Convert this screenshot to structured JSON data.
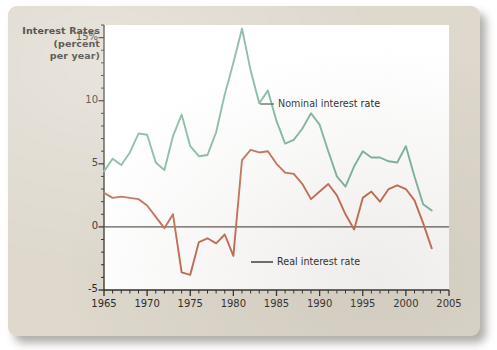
{
  "figure": {
    "axis_title_lines": [
      "Interest Rates",
      "(percent",
      "per year)"
    ],
    "background_color": "#ded8cd",
    "plot_background_color": "#ffffff"
  },
  "chart_data": {
    "type": "line",
    "title": "",
    "xlabel": "",
    "ylabel": "Interest Rates (percent per year)",
    "xlim": [
      1965,
      2005
    ],
    "ylim": [
      -5,
      16
    ],
    "grid": false,
    "legend_position": "inline-annotation",
    "y_ticks": [
      {
        "value": 15,
        "label": "15%"
      },
      {
        "value": 10,
        "label": "10"
      },
      {
        "value": 5,
        "label": "5"
      },
      {
        "value": 0,
        "label": "0"
      },
      {
        "value": -5,
        "label": "-5"
      }
    ],
    "x_ticks": [
      {
        "value": 1965,
        "label": "1965"
      },
      {
        "value": 1970,
        "label": "1970"
      },
      {
        "value": 1975,
        "label": "1975"
      },
      {
        "value": 1980,
        "label": "1980"
      },
      {
        "value": 1985,
        "label": "1985"
      },
      {
        "value": 1990,
        "label": "1990"
      },
      {
        "value": 1995,
        "label": "1995"
      },
      {
        "value": 2000,
        "label": "2000"
      },
      {
        "value": 2005,
        "label": "2005"
      }
    ],
    "x_minor_tick_interval": 1,
    "zero_line": {
      "value": 0,
      "color": "#54524e"
    },
    "x": [
      1965,
      1966,
      1967,
      1968,
      1969,
      1970,
      1971,
      1972,
      1973,
      1974,
      1975,
      1976,
      1977,
      1978,
      1979,
      1980,
      1981,
      1982,
      1983,
      1984,
      1985,
      1986,
      1987,
      1988,
      1989,
      1990,
      1991,
      1992,
      1993,
      1994,
      1995,
      1996,
      1997,
      1998,
      1999,
      2000,
      2001,
      2002,
      2003
    ],
    "series": [
      {
        "name": "Nominal interest rate",
        "color": "#7cb49b",
        "label": "Nominal interest rate",
        "values": [
          4.4,
          5.4,
          4.9,
          5.9,
          7.4,
          7.3,
          5.1,
          4.5,
          7.2,
          8.9,
          6.4,
          5.6,
          5.7,
          7.5,
          10.5,
          13.0,
          15.7,
          12.4,
          9.8,
          10.8,
          8.4,
          6.6,
          6.9,
          7.8,
          9.0,
          8.1,
          6.0,
          4.0,
          3.2,
          4.8,
          6.0,
          5.5,
          5.5,
          5.2,
          5.1,
          6.4,
          4.0,
          1.8,
          1.3
        ]
      },
      {
        "name": "Real interest rate",
        "color": "#c3694f",
        "label": "Real interest rate",
        "values": [
          2.7,
          2.3,
          2.4,
          2.3,
          2.2,
          1.7,
          0.8,
          -0.1,
          1.0,
          -3.6,
          -3.8,
          -1.2,
          -0.9,
          -1.3,
          -0.6,
          -2.3,
          5.3,
          6.1,
          5.9,
          6.0,
          5.0,
          4.3,
          4.2,
          3.4,
          2.2,
          2.8,
          3.4,
          2.5,
          1.0,
          -0.2,
          2.3,
          2.8,
          2.0,
          3.0,
          3.3,
          3.0,
          2.1,
          0.3,
          -1.7
        ]
      }
    ],
    "annotations": [
      {
        "text": "Nominal interest rate",
        "series": "Nominal interest rate",
        "dash_color": "#54524e"
      },
      {
        "text": "Real interest rate",
        "series": "Real interest rate",
        "dash_color": "#1b1a18"
      }
    ]
  }
}
